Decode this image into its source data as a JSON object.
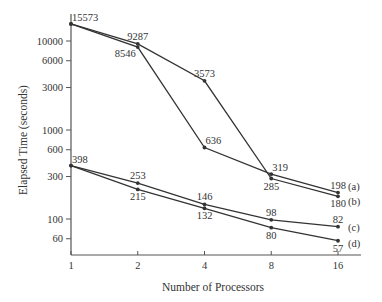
{
  "chart_data": {
    "type": "line",
    "title": "",
    "xlabel": "Number of Processors",
    "ylabel": "Elapsed Time (seconds)",
    "x_scale": "log2",
    "y_scale": "log10",
    "x": [
      1,
      2,
      4,
      8,
      16
    ],
    "x_tick_labels": [
      "1",
      "2",
      "4",
      "8",
      "16"
    ],
    "y_ticks": [
      60,
      100,
      300,
      600,
      1000,
      3000,
      6000,
      10000
    ],
    "y_tick_labels": [
      "60",
      "100",
      "300",
      "600",
      "1000",
      "3000",
      "6000",
      "10000"
    ],
    "ylim": [
      39,
      22000
    ],
    "grid": false,
    "legend_position": "inline-right",
    "series": [
      {
        "name": "(a)",
        "values": [
          15573,
          8546,
          636,
          319,
          198
        ]
      },
      {
        "name": "(b)",
        "values": [
          15573,
          9287,
          3573,
          285,
          180
        ]
      },
      {
        "name": "(c)",
        "values": [
          398,
          253,
          146,
          98,
          82
        ]
      },
      {
        "name": "(d)",
        "values": [
          398,
          215,
          132,
          80,
          57
        ]
      }
    ],
    "point_labels": [
      {
        "text": "15573",
        "x": 1,
        "y": 15573,
        "pos": "above-right"
      },
      {
        "text": "9287",
        "x": 2,
        "y": 9287,
        "pos": "above"
      },
      {
        "text": "8546",
        "x": 2,
        "y": 8546,
        "pos": "below-left"
      },
      {
        "text": "3573",
        "x": 4,
        "y": 3573,
        "pos": "above"
      },
      {
        "text": "636",
        "x": 4,
        "y": 636,
        "pos": "above-right"
      },
      {
        "text": "319",
        "x": 8,
        "y": 319,
        "pos": "above-right"
      },
      {
        "text": "285",
        "x": 8,
        "y": 285,
        "pos": "below"
      },
      {
        "text": "198",
        "x": 16,
        "y": 198,
        "pos": "above"
      },
      {
        "text": "180",
        "x": 16,
        "y": 180,
        "pos": "below"
      },
      {
        "text": "398",
        "x": 1,
        "y": 398,
        "pos": "above-right"
      },
      {
        "text": "253",
        "x": 2,
        "y": 253,
        "pos": "above"
      },
      {
        "text": "215",
        "x": 2,
        "y": 215,
        "pos": "below"
      },
      {
        "text": "146",
        "x": 4,
        "y": 146,
        "pos": "above"
      },
      {
        "text": "132",
        "x": 4,
        "y": 132,
        "pos": "below"
      },
      {
        "text": "98",
        "x": 8,
        "y": 98,
        "pos": "above"
      },
      {
        "text": "80",
        "x": 8,
        "y": 80,
        "pos": "below"
      },
      {
        "text": "82",
        "x": 16,
        "y": 82,
        "pos": "above"
      },
      {
        "text": "57",
        "x": 16,
        "y": 57,
        "pos": "below"
      }
    ],
    "colors": {
      "line": "#333333",
      "axis": "#555555",
      "text": "#333333"
    }
  }
}
